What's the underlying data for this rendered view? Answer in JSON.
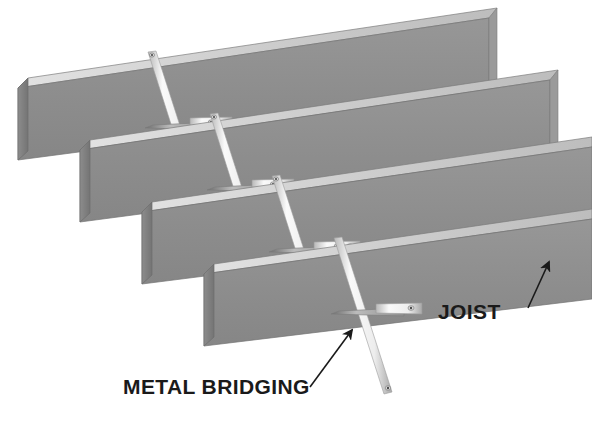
{
  "figure": {
    "type": "technical-illustration",
    "background_color": "#ffffff",
    "width": 592,
    "height": 429
  },
  "colors": {
    "joist_face": "#8e8e8e",
    "joist_top": "#cfcfcf",
    "joist_end": "#7b7b7b",
    "joist_outline": "#6f6f6f",
    "strap_light": "#f2f2f2",
    "strap_mid": "#d8d8d8",
    "strap_dark": "#8a8a8a",
    "strap_edge": "#9a9a9a",
    "callout_ink": "#1a1a1a"
  },
  "callouts": [
    {
      "id": "joist",
      "label": "JOIST",
      "text_x": 438,
      "text_y": 319,
      "leader_from_x": 528,
      "leader_from_y": 308,
      "leader_to_x": 549,
      "leader_to_y": 262
    },
    {
      "id": "metal-bridging",
      "label": "METAL BRIDGING",
      "text_x": 123,
      "text_y": 394,
      "leader_from_x": 310,
      "leader_from_y": 387,
      "leader_to_x": 352,
      "leader_to_y": 330
    }
  ],
  "joists": [
    {
      "id": "joist-1",
      "position": "top",
      "left_end_x": 18,
      "left_end_y": 88,
      "right_end_x": 489,
      "right_end_y": 18
    },
    {
      "id": "joist-2",
      "position": "upper-middle",
      "left_end_x": 78,
      "left_end_y": 150,
      "right_end_x": 549,
      "right_end_y": 80
    },
    {
      "id": "joist-3",
      "position": "lower-middle",
      "left_end_x": 140,
      "left_end_y": 212,
      "right_end_x": 592,
      "right_end_y": 148
    },
    {
      "id": "joist-4",
      "position": "bottom",
      "left_end_x": 202,
      "left_end_y": 274,
      "right_end_x": 592,
      "right_end_y": 214
    }
  ],
  "bridging_sets": [
    {
      "id": "bridging-1",
      "bay": "between joist 1 and joist 2",
      "cross_x": 188,
      "cross_y": 120,
      "straps": 2
    },
    {
      "id": "bridging-2",
      "bay": "between joist 2 and joist 3",
      "cross_x": 250,
      "cross_y": 182,
      "straps": 2
    },
    {
      "id": "bridging-3",
      "bay": "between joist 3 and joist 4",
      "cross_x": 312,
      "cross_y": 244,
      "straps": 2
    },
    {
      "id": "bridging-4",
      "bay": "below joist 4",
      "cross_x": 374,
      "cross_y": 306,
      "straps": 2
    }
  ]
}
